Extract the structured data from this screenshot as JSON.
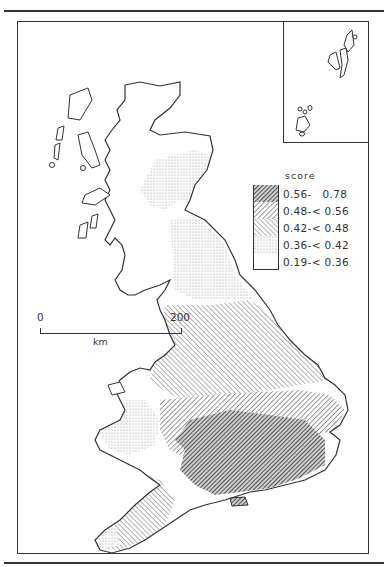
{
  "map": {
    "region": "Great Britain",
    "type": "choropleth",
    "variable": "score"
  },
  "legend": {
    "title": "score",
    "items": [
      {
        "label": "0.56-   0.78",
        "pattern": "dense-diagonal-dark"
      },
      {
        "label": "0.48-< 0.56",
        "pattern": "diagonal-medium"
      },
      {
        "label": "0.42-< 0.48",
        "pattern": "diagonal-light"
      },
      {
        "label": "0.36-< 0.42",
        "pattern": "stipple"
      },
      {
        "label": "0.19-< 0.36",
        "pattern": "blank"
      }
    ]
  },
  "scale_bar": {
    "start": "0",
    "end": "200",
    "unit": "km"
  },
  "inset": {
    "content": "Shetland and Orkney islands"
  }
}
